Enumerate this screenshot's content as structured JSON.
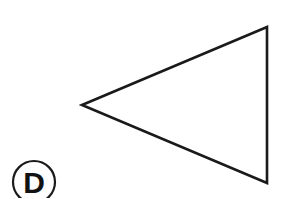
{
  "figure": {
    "background_color": "#ffffff",
    "ink_color": "#1a1a1a",
    "width": 292,
    "height": 198,
    "label": {
      "text": "D",
      "style": "circled-bold-letter",
      "center_x": 34,
      "center_y": 182,
      "radius": 21,
      "clipped_by_bottom_edge": true
    },
    "shape": {
      "name": "triangle",
      "description": "Left-pointing isoceles triangle with vertical right edge",
      "orientation": "pointing-left",
      "fill": "none",
      "stroke_width": 2.6,
      "vertices": [
        {
          "name": "apex-left",
          "x": 82,
          "y": 105
        },
        {
          "name": "top-right",
          "x": 267,
          "y": 27
        },
        {
          "name": "bottom-right",
          "x": 267,
          "y": 183
        }
      ],
      "edges": [
        {
          "name": "upper-slope",
          "from": "apex-left",
          "to": "top-right"
        },
        {
          "name": "right-vertical",
          "from": "top-right",
          "to": "bottom-right"
        },
        {
          "name": "lower-slope",
          "from": "bottom-right",
          "to": "apex-left"
        }
      ]
    }
  }
}
